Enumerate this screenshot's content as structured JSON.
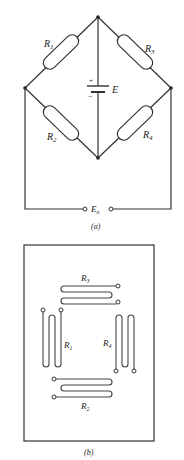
{
  "figure_a": {
    "caption": "(a)",
    "resistors": [
      {
        "id": "R1",
        "label": "R",
        "sub": "1"
      },
      {
        "id": "R2",
        "label": "R",
        "sub": "2"
      },
      {
        "id": "R3",
        "label": "R",
        "sub": "3"
      },
      {
        "id": "R4",
        "label": "R",
        "sub": "4"
      }
    ],
    "source": {
      "label": "E",
      "plus": "+",
      "minus": "−"
    },
    "output": {
      "label": "E",
      "sub": "o"
    }
  },
  "figure_b": {
    "caption": "(b)",
    "gauges": [
      {
        "id": "R3",
        "label": "R",
        "sub": "3"
      },
      {
        "id": "R1",
        "label": "R",
        "sub": "1"
      },
      {
        "id": "R4",
        "label": "R",
        "sub": "4"
      },
      {
        "id": "R2",
        "label": "R",
        "sub": "2"
      }
    ]
  }
}
